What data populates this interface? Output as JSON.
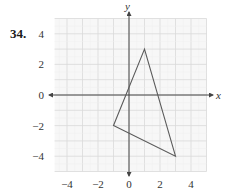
{
  "problem": {
    "number": "34."
  },
  "chart_data": {
    "type": "line",
    "title": "",
    "xlabel": "x",
    "ylabel": "y",
    "xlim": [
      -4.8,
      5
    ],
    "ylim": [
      -5,
      5
    ],
    "grid": true,
    "x_ticks": [
      -4,
      -2,
      0,
      2,
      4
    ],
    "y_ticks": [
      4,
      2,
      0,
      -2,
      -4
    ],
    "x_tick_labels": [
      "−4",
      "−2",
      "0",
      "2",
      "4"
    ],
    "y_tick_labels": [
      "4",
      "2",
      "0",
      "−2",
      "−4"
    ],
    "series": [
      {
        "name": "triangle",
        "closed": true,
        "points": [
          {
            "x": 1,
            "y": 3
          },
          {
            "x": 3,
            "y": -4
          },
          {
            "x": -1,
            "y": -2
          }
        ]
      }
    ]
  },
  "colors": {
    "grid_major": "#d9d9d9",
    "grid_minor": "#eeeeee",
    "grid_bg": "#f7f7f7",
    "axis": "#444444",
    "triangle": "#5a5a5a"
  }
}
